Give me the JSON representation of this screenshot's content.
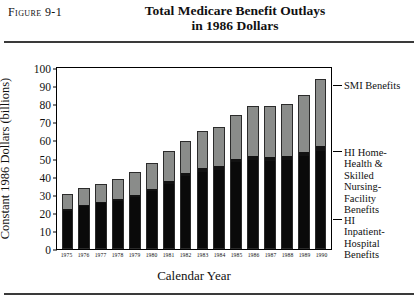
{
  "figure": {
    "label": "Figure 9-1",
    "title_line1": "Total Medicare Benefit Outlays",
    "title_line2": "in 1986 Dollars"
  },
  "chart_data": {
    "type": "bar",
    "stacked": true,
    "title": "Total Medicare Benefit Outlays in 1986 Dollars",
    "xlabel": "Calendar Year",
    "ylabel": "Constant 1986 Dollars (billions)",
    "ylim": [
      0,
      100
    ],
    "yticks": [
      0,
      10,
      20,
      30,
      40,
      50,
      60,
      70,
      80,
      90,
      100
    ],
    "grid": false,
    "legend_position": "right",
    "categories": [
      "1975",
      "1976",
      "1977",
      "1978",
      "1979",
      "1980",
      "1981",
      "1982",
      "1983",
      "1984",
      "1985",
      "1986",
      "1987",
      "1988",
      "1989",
      "1990"
    ],
    "series": [
      {
        "name": "HI Inpatient-Hospital Benefits",
        "color": "#0a0a0a",
        "values": [
          21.5,
          24.0,
          25.5,
          27.0,
          29.0,
          32.0,
          36.0,
          40.5,
          43.0,
          44.0,
          48.0,
          49.5,
          49.0,
          49.5,
          51.5,
          54.0
        ]
      },
      {
        "name": "HI Home-Health & Skilled Nursing-Facility Benefits",
        "color": "#121212",
        "values": [
          0.7,
          0.8,
          0.9,
          1.0,
          1.2,
          1.4,
          1.6,
          1.8,
          2.0,
          2.2,
          2.0,
          2.0,
          2.0,
          2.2,
          2.5,
          2.8
        ]
      },
      {
        "name": "SMI Benefits",
        "color": "#8a8c8a",
        "values": [
          8.0,
          8.7,
          9.6,
          10.5,
          12.3,
          14.1,
          16.4,
          17.2,
          20.0,
          21.3,
          24.0,
          27.5,
          28.0,
          28.3,
          31.0,
          37.2
        ]
      }
    ],
    "totals": [
      30.2,
      33.5,
      36.0,
      38.5,
      42.5,
      47.5,
      54.0,
      59.5,
      65.0,
      67.5,
      74.0,
      79.0,
      79.0,
      80.0,
      85.0,
      94.0
    ],
    "legend_labels": [
      "SMI Benefits",
      "HI Home-Health & Skilled Nursing-Facility Benefits",
      "HI Inpatient-Hospital Benefits"
    ]
  },
  "legend": {
    "smi": "SMI Benefits",
    "hi_home": "HI Home-\nHealth &\nSkilled\nNursing-\nFacility\nBenefits",
    "hi_hosp": "HI\nInpatient-\nHospital\nBenefits"
  }
}
